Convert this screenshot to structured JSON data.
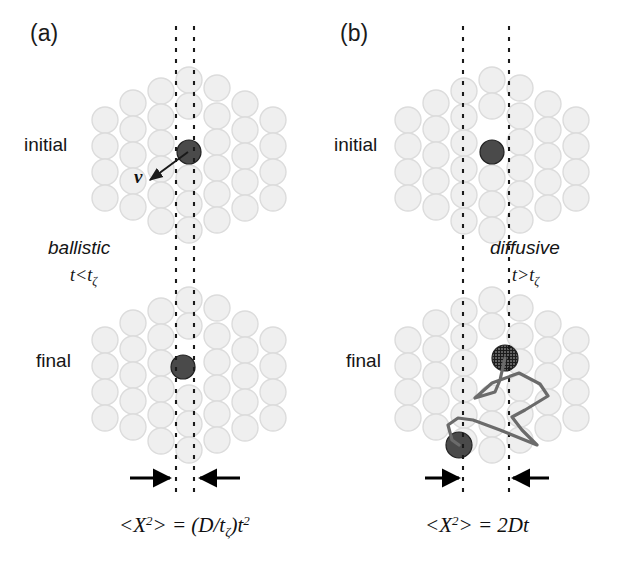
{
  "figure": {
    "width": 639,
    "height": 564,
    "background": "#ffffff"
  },
  "colors": {
    "medium_particle_fill": "#efefef",
    "medium_particle_stroke": "#dcdcdc",
    "tracer_dark": "#4a4a4a",
    "tracer_hatched": "#1e1e1e",
    "dashed_line": "#1a1a1a",
    "arrow": "#000000",
    "path_line": "#6b6b6b",
    "text": "#111111"
  },
  "panels": [
    {
      "id": "a",
      "label": "(a)",
      "label_pos": [
        30,
        20
      ],
      "states": [
        {
          "name": "initial",
          "label": "initial",
          "label_pos": [
            24,
            134
          ]
        },
        {
          "name": "final",
          "label": "final",
          "label_pos": [
            36,
            350
          ]
        }
      ],
      "regime": {
        "name": "ballistic",
        "label": "ballistic",
        "label_pos": [
          48,
          237
        ],
        "condition_prefix": "t<t",
        "condition_sub": "ζ",
        "condition_pos": [
          70,
          265
        ]
      },
      "velocity_arrow": {
        "label": "v",
        "label_pos": [
          134,
          166
        ],
        "from": [
          188,
          152
        ],
        "to": [
          150,
          180
        ]
      },
      "guide_lines": {
        "x_left": 176,
        "x_right": 194,
        "top": 26,
        "bottom": 496
      },
      "displacement_arrows": {
        "left": {
          "from": [
            130,
            478
          ],
          "to": [
            170,
            478
          ]
        },
        "right": {
          "from": [
            240,
            478
          ],
          "to": [
            200,
            478
          ]
        }
      },
      "formula": {
        "text": "<X^2> = (D/t_ζ)t^2",
        "mean_open": "<X",
        "mean_exp": "2",
        "mean_close": "> = (D/t",
        "tau_sub": "ζ",
        "tail": ")t",
        "tail_exp": "2",
        "pos": [
          119,
          513
        ]
      }
    },
    {
      "id": "b",
      "label": "(b)",
      "label_pos": [
        340,
        20
      ],
      "states": [
        {
          "name": "initial",
          "label": "initial",
          "label_pos": [
            334,
            134
          ]
        },
        {
          "name": "final",
          "label": "final",
          "label_pos": [
            346,
            350
          ]
        }
      ],
      "regime": {
        "name": "diffusive",
        "label": "diffusive",
        "label_pos": [
          490,
          237
        ],
        "condition_prefix": "t>t",
        "condition_sub": "ζ",
        "condition_pos": [
          512,
          265
        ]
      },
      "guide_lines": {
        "x_left": 463,
        "x_right": 509,
        "top": 26,
        "bottom": 496
      },
      "displacement_arrows": {
        "left": {
          "from": [
            425,
            478
          ],
          "to": [
            459,
            478
          ]
        },
        "right": {
          "from": [
            549,
            478
          ],
          "to": [
            513,
            478
          ]
        }
      },
      "random_walk": {
        "start": [
          505,
          358
        ],
        "end": [
          459,
          445
        ],
        "points": [
          [
            505,
            358
          ],
          [
            500,
            380
          ],
          [
            495,
            392
          ],
          [
            475,
            398
          ],
          [
            492,
            383
          ],
          [
            519,
            373
          ],
          [
            540,
            384
          ],
          [
            548,
            396
          ],
          [
            525,
            410
          ],
          [
            512,
            417
          ],
          [
            522,
            430
          ],
          [
            537,
            445
          ],
          [
            500,
            430
          ],
          [
            473,
            420
          ],
          [
            458,
            418
          ],
          [
            448,
            425
          ],
          [
            452,
            440
          ],
          [
            459,
            445
          ]
        ]
      },
      "formula": {
        "text": "<X^2> = 2Dt",
        "mean_open": "<X",
        "mean_exp": "2",
        "mean_close": "> = 2Dt",
        "pos": [
          425,
          513
        ]
      }
    }
  ],
  "clusters": {
    "a_initial": {
      "tracer": {
        "cx": 189,
        "cy": 152,
        "r": 12,
        "style": "solid-dark"
      },
      "particles": [
        [
          189,
          80
        ],
        [
          161,
          91
        ],
        [
          217,
          88
        ],
        [
          133,
          103
        ],
        [
          245,
          104
        ],
        [
          189,
          106
        ],
        [
          105,
          120
        ],
        [
          161,
          117
        ],
        [
          217,
          116
        ],
        [
          273,
          120
        ],
        [
          133,
          129
        ],
        [
          245,
          130
        ],
        [
          105,
          146
        ],
        [
          161,
          143
        ],
        [
          273,
          146
        ],
        [
          217,
          142
        ],
        [
          133,
          155
        ],
        [
          189,
          178
        ],
        [
          245,
          156
        ],
        [
          105,
          172
        ],
        [
          161,
          169
        ],
        [
          217,
          168
        ],
        [
          273,
          172
        ],
        [
          133,
          181
        ],
        [
          245,
          182
        ],
        [
          161,
          195
        ],
        [
          189,
          204
        ],
        [
          217,
          194
        ],
        [
          105,
          198
        ],
        [
          273,
          198
        ],
        [
          133,
          207
        ],
        [
          245,
          208
        ],
        [
          189,
          230
        ],
        [
          161,
          221
        ],
        [
          217,
          220
        ]
      ]
    },
    "a_final": {
      "tracer": {
        "cx": 183,
        "cy": 367,
        "r": 12,
        "style": "solid-dark"
      },
      "particles": [
        [
          189,
          300
        ],
        [
          161,
          311
        ],
        [
          217,
          308
        ],
        [
          133,
          323
        ],
        [
          245,
          324
        ],
        [
          189,
          326
        ],
        [
          105,
          340
        ],
        [
          161,
          337
        ],
        [
          217,
          336
        ],
        [
          273,
          340
        ],
        [
          133,
          349
        ],
        [
          245,
          350
        ],
        [
          105,
          366
        ],
        [
          161,
          363
        ],
        [
          273,
          366
        ],
        [
          217,
          362
        ],
        [
          133,
          375
        ],
        [
          189,
          398
        ],
        [
          245,
          376
        ],
        [
          105,
          392
        ],
        [
          161,
          389
        ],
        [
          217,
          388
        ],
        [
          273,
          392
        ],
        [
          133,
          401
        ],
        [
          245,
          402
        ],
        [
          161,
          415
        ],
        [
          189,
          424
        ],
        [
          217,
          414
        ],
        [
          105,
          418
        ],
        [
          273,
          418
        ],
        [
          133,
          427
        ],
        [
          245,
          428
        ],
        [
          189,
          450
        ],
        [
          161,
          441
        ],
        [
          217,
          440
        ]
      ]
    },
    "b_initial": {
      "tracer": {
        "cx": 492,
        "cy": 152,
        "r": 12,
        "style": "solid-dark"
      },
      "particles": [
        [
          492,
          80
        ],
        [
          464,
          91
        ],
        [
          520,
          88
        ],
        [
          436,
          103
        ],
        [
          548,
          104
        ],
        [
          492,
          106
        ],
        [
          408,
          120
        ],
        [
          464,
          117
        ],
        [
          520,
          116
        ],
        [
          576,
          120
        ],
        [
          436,
          129
        ],
        [
          548,
          130
        ],
        [
          408,
          146
        ],
        [
          464,
          143
        ],
        [
          576,
          146
        ],
        [
          520,
          142
        ],
        [
          436,
          155
        ],
        [
          492,
          178
        ],
        [
          548,
          156
        ],
        [
          408,
          172
        ],
        [
          464,
          169
        ],
        [
          520,
          168
        ],
        [
          576,
          172
        ],
        [
          436,
          181
        ],
        [
          548,
          182
        ],
        [
          464,
          195
        ],
        [
          492,
          204
        ],
        [
          520,
          194
        ],
        [
          408,
          198
        ],
        [
          576,
          198
        ],
        [
          436,
          207
        ],
        [
          548,
          208
        ],
        [
          492,
          230
        ],
        [
          464,
          221
        ],
        [
          520,
          220
        ]
      ]
    },
    "b_final": {
      "tracer_start": {
        "cx": 505,
        "cy": 358,
        "r": 13,
        "style": "hatched"
      },
      "tracer_end": {
        "cx": 459,
        "cy": 445,
        "r": 13,
        "style": "solid-dark"
      },
      "particles": [
        [
          492,
          300
        ],
        [
          464,
          311
        ],
        [
          520,
          308
        ],
        [
          436,
          323
        ],
        [
          548,
          324
        ],
        [
          492,
          326
        ],
        [
          408,
          340
        ],
        [
          464,
          337
        ],
        [
          520,
          336
        ],
        [
          576,
          340
        ],
        [
          436,
          349
        ],
        [
          548,
          350
        ],
        [
          408,
          366
        ],
        [
          464,
          363
        ],
        [
          576,
          366
        ],
        [
          520,
          362
        ],
        [
          436,
          375
        ],
        [
          492,
          398
        ],
        [
          548,
          376
        ],
        [
          408,
          392
        ],
        [
          464,
          389
        ],
        [
          520,
          388
        ],
        [
          576,
          392
        ],
        [
          436,
          401
        ],
        [
          548,
          402
        ],
        [
          464,
          415
        ],
        [
          492,
          424
        ],
        [
          520,
          414
        ],
        [
          408,
          418
        ],
        [
          576,
          418
        ],
        [
          436,
          427
        ],
        [
          548,
          428
        ],
        [
          492,
          450
        ],
        [
          464,
          441
        ],
        [
          520,
          440
        ]
      ]
    }
  }
}
